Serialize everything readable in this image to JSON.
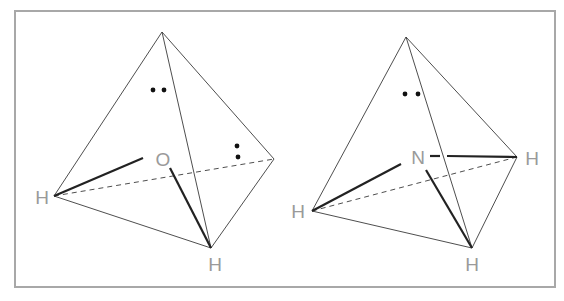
{
  "figure": {
    "frame": {
      "x": 15,
      "y": 11,
      "width": 540,
      "height": 276,
      "color": "#a8a8a8"
    },
    "label_color": "#9a9a9a",
    "line_color": "#3a3a3a"
  },
  "molecules": [
    {
      "name": "water",
      "central_atom": {
        "symbol": "O",
        "x": 163,
        "y": 159
      },
      "vertices": {
        "apex": [
          162,
          32
        ],
        "left": [
          54,
          196
        ],
        "bottom": [
          211,
          248
        ],
        "right": [
          274,
          159
        ]
      },
      "hydrogens": [
        {
          "symbol": "H",
          "label_x": 42,
          "label_y": 197
        },
        {
          "symbol": "H",
          "label_x": 215,
          "label_y": 264
        }
      ],
      "lone_pairs": [
        {
          "orientation": "horizontal",
          "dots": [
            [
              153,
              90
            ],
            [
              164,
              90
            ]
          ]
        },
        {
          "orientation": "vertical",
          "dots": [
            [
              237,
              146
            ],
            [
              238,
              157
            ]
          ]
        }
      ]
    },
    {
      "name": "ammonia",
      "central_atom": {
        "symbol": "N",
        "x": 418,
        "y": 157
      },
      "vertices": {
        "apex": [
          406,
          37
        ],
        "left": [
          312,
          211
        ],
        "bottom": [
          472,
          248
        ],
        "right": [
          517,
          157
        ]
      },
      "hydrogens": [
        {
          "symbol": "H",
          "label_x": 298,
          "label_y": 211
        },
        {
          "symbol": "H",
          "label_x": 472,
          "label_y": 264
        },
        {
          "symbol": "H",
          "label_x": 532,
          "label_y": 158
        }
      ],
      "lone_pairs": [
        {
          "orientation": "horizontal",
          "dots": [
            [
              405,
              94
            ],
            [
              418,
              94
            ]
          ]
        }
      ]
    }
  ]
}
